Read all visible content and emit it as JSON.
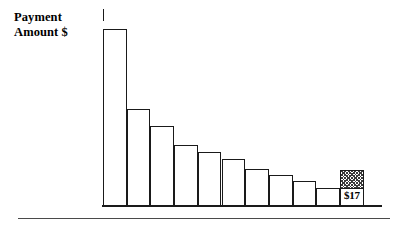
{
  "axis": {
    "y_label_line1": "Payment",
    "y_label_line2": "Amount $"
  },
  "annotations": {
    "last_bar_value": "$17"
  },
  "chart_data": {
    "type": "bar",
    "title": "",
    "subtitle": "",
    "xlabel": "",
    "ylabel": "Payment Amount $",
    "grid": false,
    "legend": null,
    "axis_tick_labels_x": [],
    "axis_tick_labels_y": [],
    "categories": [
      "1",
      "2",
      "3",
      "4",
      "5",
      "6",
      "7",
      "8",
      "9",
      "10",
      "11"
    ],
    "values": [
      186,
      102,
      84,
      64,
      57,
      50,
      39,
      33,
      26,
      19,
      38
    ],
    "ylim": [
      0,
      196
    ],
    "bars": [
      {
        "index": 1,
        "label": "1",
        "value": 186,
        "fill": "white",
        "data_label": ""
      },
      {
        "index": 2,
        "label": "2",
        "value": 102,
        "fill": "white",
        "data_label": ""
      },
      {
        "index": 3,
        "label": "3",
        "value": 84,
        "fill": "white",
        "data_label": ""
      },
      {
        "index": 4,
        "label": "4",
        "value": 64,
        "fill": "white",
        "data_label": ""
      },
      {
        "index": 5,
        "label": "5",
        "value": 57,
        "fill": "white",
        "data_label": ""
      },
      {
        "index": 6,
        "label": "6",
        "value": 50,
        "fill": "white",
        "data_label": ""
      },
      {
        "index": 7,
        "label": "7",
        "value": 39,
        "fill": "white",
        "data_label": ""
      },
      {
        "index": 8,
        "label": "8",
        "value": 33,
        "fill": "white",
        "data_label": ""
      },
      {
        "index": 9,
        "label": "9",
        "value": 26,
        "fill": "white",
        "data_label": ""
      },
      {
        "index": 10,
        "label": "10",
        "value": 19,
        "fill": "white",
        "data_label": ""
      },
      {
        "index": 11,
        "label": "11",
        "value": 38,
        "fill": "hatched",
        "data_label": "$17"
      }
    ]
  },
  "colors": {
    "stroke": "#1a1a1a",
    "bar_fill": "#ffffff",
    "hatch": "#3a3a3a",
    "rule": "#4a4a4a",
    "background": "#ffffff"
  }
}
